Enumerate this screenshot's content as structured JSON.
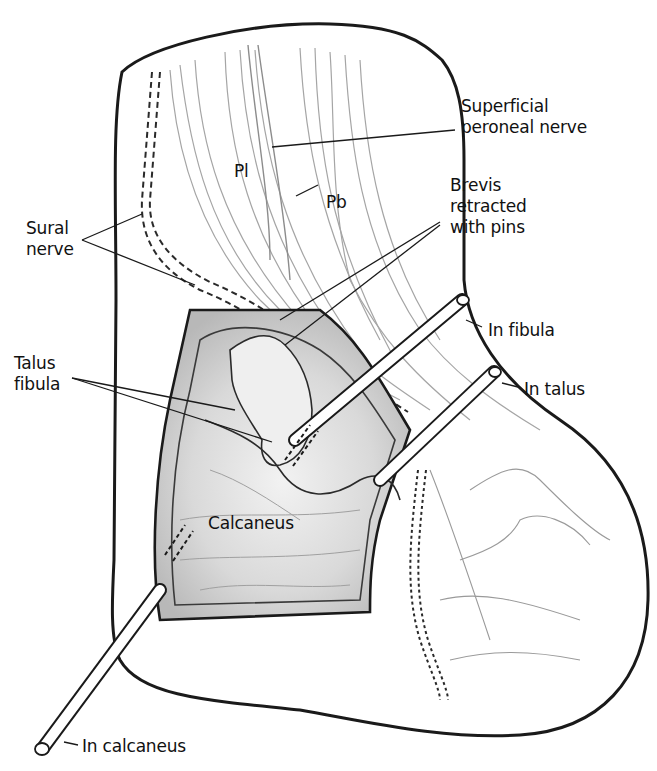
{
  "figure": {
    "labels": {
      "superficial_peroneal_nerve": "Superficial\nperoneal nerve",
      "pl": "Pl",
      "pb": "Pb",
      "brevis_retracted": "Brevis\nretracted\nwith pins",
      "sural_nerve": "Sural\nnerve",
      "talus_fibula": "Talus\nfibula",
      "in_fibula": "In fibula",
      "in_talus": "In talus",
      "calcaneus": "Calcaneus",
      "in_calcaneus": "In calcaneus"
    },
    "colors": {
      "outline": "#1a1a1a",
      "sketch": "#9a9a9a",
      "shade": "#d4d4d4",
      "background": "#ffffff"
    }
  }
}
